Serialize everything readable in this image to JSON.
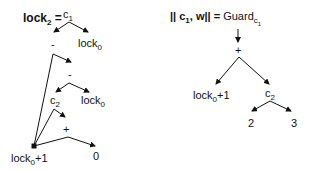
{
  "left_tree": {
    "title": {
      "prefix": "lock",
      "sub": "2",
      "suffix": " ="
    },
    "root": {
      "text": "c",
      "sub": "1"
    },
    "minus1": "-",
    "lock0_a": {
      "text": "lock",
      "sub": "0"
    },
    "minus2": "-",
    "c2": {
      "text": "c",
      "sub": "2"
    },
    "lock0_b": {
      "text": "lock",
      "sub": "0"
    },
    "plus": "+",
    "lock0_plus1": {
      "text": "lock",
      "sub": "0",
      "suffix": "+1"
    },
    "zero": "0"
  },
  "right_tree": {
    "title": {
      "prefix": "|| c",
      "sub": "1",
      "suffix": ", w|| = "
    },
    "guard": {
      "text": "Guard",
      "sub": "c",
      "subsub": "1"
    },
    "plus": "+",
    "lock0_plus1": {
      "text": "lock",
      "sub": "0",
      "suffix": "+1"
    },
    "c2": {
      "text": "c",
      "sub": "2"
    },
    "two": "2",
    "three": "3"
  },
  "colors": {
    "ink": "#111111",
    "background": "#ffffff"
  }
}
